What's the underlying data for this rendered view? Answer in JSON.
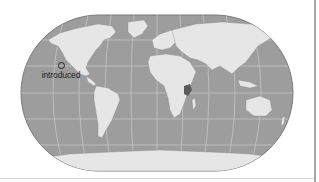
{
  "map": {
    "type": "world distribution map",
    "projection": "pseudo-cylindrical (rounded rectangle)",
    "colors": {
      "ocean": "#9d9d9d",
      "land": "#e6e6e6",
      "graticule": "#c4c4c4",
      "native_range": "#5a5a5a",
      "outline": "#7a7a7a"
    },
    "legend": {
      "introduced": {
        "symbol": "circle-outline",
        "label": "introduced"
      }
    },
    "native_range_region": "East Africa"
  }
}
